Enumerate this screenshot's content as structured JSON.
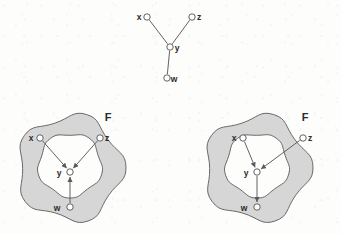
{
  "figure": {
    "caption_label": "",
    "width": 341,
    "height": 234,
    "background_color": "#fdfdfc",
    "stroke_color": "#5a5a5a",
    "label_color": "#2b2b2b",
    "blob_fill_color": "#d6d6d6",
    "blob_inner_fill_color": "#fdfdfc",
    "node_fill_color": "#ffffff"
  },
  "panels": [
    {
      "id": "top-graph",
      "name": "undirected-graph",
      "set_label": "",
      "has_blob": false,
      "nodes": [
        {
          "id": "x",
          "label": "x",
          "cx": 147,
          "cy": 17,
          "r": 3.2,
          "label_x": 139,
          "label_y": 20
        },
        {
          "id": "z",
          "label": "z",
          "cx": 192,
          "cy": 17,
          "r": 3.2,
          "label_x": 199,
          "label_y": 20
        },
        {
          "id": "y",
          "label": "y",
          "cx": 170,
          "cy": 47,
          "r": 3.2,
          "label_x": 177,
          "label_y": 51
        },
        {
          "id": "w",
          "label": "w",
          "cx": 167,
          "cy": 78,
          "r": 3.2,
          "label_x": 174,
          "label_y": 82
        }
      ],
      "edges": [
        {
          "from": "x",
          "to": "y",
          "directed": false
        },
        {
          "from": "z",
          "to": "y",
          "directed": false
        },
        {
          "from": "y",
          "to": "w",
          "directed": false
        }
      ]
    },
    {
      "id": "bottom-left-graph",
      "name": "directed-graph-w-to-y",
      "set_label": "F",
      "set_label_x": 108,
      "set_label_y": 121,
      "has_blob": true,
      "blob_cx": 70,
      "blob_cy": 168,
      "nodes": [
        {
          "id": "x",
          "label": "x",
          "cx": 40,
          "cy": 138,
          "r": 3.2,
          "label_x": 31,
          "label_y": 141
        },
        {
          "id": "z",
          "label": "z",
          "cx": 100,
          "cy": 138,
          "r": 3.2,
          "label_x": 107,
          "label_y": 141
        },
        {
          "id": "y",
          "label": "y",
          "cx": 70,
          "cy": 172,
          "r": 3.2,
          "label_x": 59,
          "label_y": 176
        },
        {
          "id": "w",
          "label": "w",
          "cx": 70,
          "cy": 207,
          "r": 3.2,
          "label_x": 57,
          "label_y": 211
        }
      ],
      "edges": [
        {
          "from": "x",
          "to": "y",
          "directed": true
        },
        {
          "from": "z",
          "to": "y",
          "directed": true
        },
        {
          "from": "w",
          "to": "y",
          "directed": true
        }
      ]
    },
    {
      "id": "bottom-right-graph",
      "name": "directed-graph-y-to-w",
      "set_label": "F",
      "set_label_x": 305,
      "set_label_y": 121,
      "has_blob": true,
      "blob_cx": 257,
      "blob_cy": 168,
      "nodes": [
        {
          "id": "x",
          "label": "x",
          "cx": 243,
          "cy": 138,
          "r": 3.2,
          "label_x": 234,
          "label_y": 141
        },
        {
          "id": "z",
          "label": "z",
          "cx": 303,
          "cy": 138,
          "r": 3.2,
          "label_x": 310,
          "label_y": 141
        },
        {
          "id": "y",
          "label": "y",
          "cx": 257,
          "cy": 172,
          "r": 3.2,
          "label_x": 246,
          "label_y": 176
        },
        {
          "id": "w",
          "label": "w",
          "cx": 257,
          "cy": 207,
          "r": 3.2,
          "label_x": 244,
          "label_y": 211
        }
      ],
      "edges": [
        {
          "from": "x",
          "to": "y",
          "directed": true
        },
        {
          "from": "z",
          "to": "y",
          "directed": true
        },
        {
          "from": "y",
          "to": "w",
          "directed": true
        }
      ]
    }
  ]
}
